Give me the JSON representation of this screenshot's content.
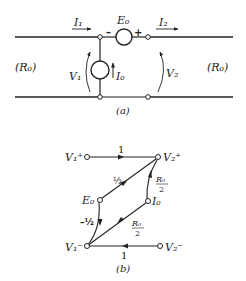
{
  "figure_a": {
    "caption": "(a)",
    "left_termination": "(R₀)",
    "right_termination": "(R₀)",
    "current_in": "I₁",
    "current_out": "I₂",
    "series_source": "E₀",
    "series_source_minus": "–",
    "series_source_plus": "+",
    "shunt_source": "I₀",
    "voltage_in": "V₁",
    "voltage_out": "V₂"
  },
  "figure_b": {
    "caption": "(b)",
    "nodes": {
      "v1_plus": "V₁⁺",
      "v2_plus": "V₂⁺",
      "e0": "E₀",
      "i0": "I₀",
      "v1_minus": "V₁⁻",
      "v2_minus": "V₂⁻"
    },
    "branches": {
      "v1p_to_v2p": "1",
      "e0_to_v2p": "½",
      "i0_to_v2p_num": "R₀",
      "i0_to_v2p_den": "2",
      "e0_to_v1m": "–½",
      "i0_to_v1m_num": "R₀",
      "i0_to_v1m_den": "2",
      "v2m_to_v1m": "1"
    }
  }
}
